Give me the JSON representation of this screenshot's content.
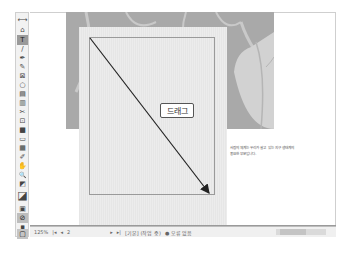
{
  "toolbar": {
    "tools": [
      {
        "name": "gap-tool",
        "glyph": "⟷"
      },
      {
        "name": "content-collector-tool",
        "glyph": "⌂"
      },
      {
        "name": "type-tool",
        "glyph": "T",
        "active": true
      },
      {
        "name": "line-tool",
        "glyph": "/"
      },
      {
        "name": "pen-tool",
        "glyph": "✒"
      },
      {
        "name": "pencil-tool",
        "glyph": "✎"
      },
      {
        "name": "rectangle-frame-tool",
        "glyph": "⊠"
      },
      {
        "name": "ellipse-tool",
        "glyph": "○"
      },
      {
        "name": "table-tool",
        "glyph": "▤"
      },
      {
        "name": "column-tool",
        "glyph": "▥"
      },
      {
        "name": "scissors-tool",
        "glyph": "✂"
      },
      {
        "name": "free-transform-tool",
        "glyph": "⊡"
      },
      {
        "name": "gradient-swatch-tool",
        "glyph": "■"
      },
      {
        "name": "gradient-feather-tool",
        "glyph": "▭"
      },
      {
        "name": "note-tool",
        "glyph": "▦"
      },
      {
        "name": "eyedropper-tool",
        "glyph": "✐"
      },
      {
        "name": "hand-tool",
        "glyph": "✋"
      },
      {
        "name": "zoom-tool",
        "glyph": "🔍"
      },
      {
        "name": "default-colors",
        "glyph": "◩"
      },
      {
        "name": "fill-stroke-swatch",
        "glyph": "◪"
      },
      {
        "name": "formatting-container",
        "glyph": "▣"
      },
      {
        "name": "apply-none",
        "glyph": "⊘"
      },
      {
        "name": "normal-view",
        "glyph": "▪"
      },
      {
        "name": "screen-mode",
        "glyph": "▢"
      }
    ]
  },
  "canvas": {
    "drag_label": "드래그",
    "body_text_line1": "사람의 체계는 우리가 살고 있는 지구 생태계의",
    "body_text_line2": "중요한 부분입니다."
  },
  "statusbar": {
    "zoom": "125%",
    "page_nav_first": "|◂",
    "page_nav_prev": "◂",
    "page_number": "2",
    "page_nav_next": "▸",
    "page_nav_last": "▸|",
    "preflight_profile": "[기본] (작업 중)",
    "error_status": "● 오류 없음"
  },
  "colors": {
    "background_image": "#a9a9a9",
    "page": "#e9e9e9",
    "arrow": "#222222"
  }
}
